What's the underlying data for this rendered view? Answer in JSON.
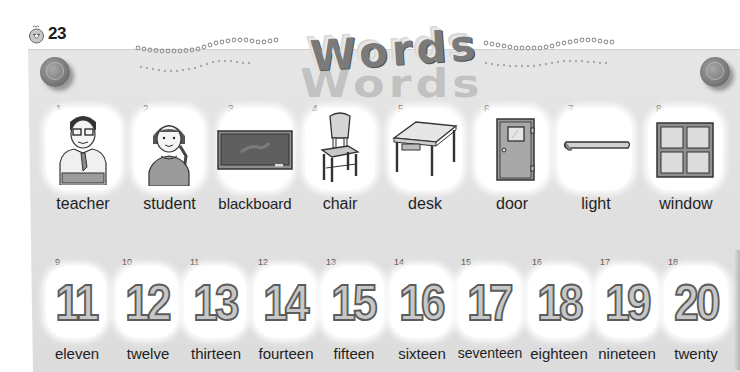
{
  "header": {
    "track_icon": "cd-icon",
    "track_number": "23",
    "title": "Words",
    "title_shadow": "Words"
  },
  "vocabulary_row_1": [
    {
      "index": "1",
      "word": "teacher",
      "icon": "teacher-illustration"
    },
    {
      "index": "2",
      "word": "student",
      "icon": "student-illustration"
    },
    {
      "index": "3",
      "word": "blackboard",
      "icon": "blackboard-illustration"
    },
    {
      "index": "4",
      "word": "chair",
      "icon": "chair-illustration"
    },
    {
      "index": "5",
      "word": "desk",
      "icon": "desk-illustration"
    },
    {
      "index": "6",
      "word": "door",
      "icon": "door-illustration"
    },
    {
      "index": "7",
      "word": "light",
      "icon": "light-illustration"
    },
    {
      "index": "8",
      "word": "window",
      "icon": "window-illustration"
    }
  ],
  "vocabulary_row_2": [
    {
      "index": "9",
      "numeral": "11",
      "word": "eleven"
    },
    {
      "index": "10",
      "numeral": "12",
      "word": "twelve"
    },
    {
      "index": "11",
      "numeral": "13",
      "word": "thirteen"
    },
    {
      "index": "12",
      "numeral": "14",
      "word": "fourteen"
    },
    {
      "index": "13",
      "numeral": "15",
      "word": "fifteen"
    },
    {
      "index": "14",
      "numeral": "16",
      "word": "sixteen"
    },
    {
      "index": "15",
      "numeral": "17",
      "word": "seventeen"
    },
    {
      "index": "16",
      "numeral": "18",
      "word": "eighteen"
    },
    {
      "index": "17",
      "numeral": "19",
      "word": "nineteen"
    },
    {
      "index": "18",
      "numeral": "20",
      "word": "twenty"
    }
  ],
  "colors": {
    "board": "#e2e2e2",
    "bubble": "#ffffff",
    "text": "#1f1f1f",
    "pin": "#7d7d7d"
  }
}
